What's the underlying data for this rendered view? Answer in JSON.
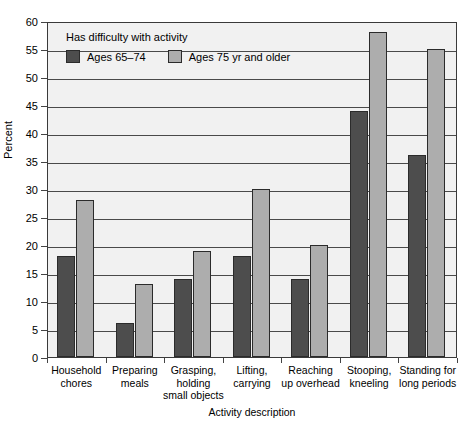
{
  "chart_data": {
    "type": "bar",
    "title": "",
    "xlabel": "Activity description",
    "ylabel": "Percent",
    "ylim": [
      0,
      60
    ],
    "ytick_step": 5,
    "yticks": [
      60,
      55,
      50,
      45,
      40,
      35,
      30,
      25,
      20,
      15,
      10,
      5,
      0
    ],
    "grid": true,
    "legend_position": "inside-top-left",
    "legend_title": "Has difficulty with activity",
    "categories": [
      "Household chores",
      "Preparing meals",
      "Grasping, holding small objects",
      "Lifting, carrying",
      "Reaching up overhead",
      "Stooping, kneeling",
      "Standing for long periods"
    ],
    "category_lines": [
      [
        "Household",
        "chores"
      ],
      [
        "Preparing",
        "meals"
      ],
      [
        "Grasping,",
        "holding",
        "small objects"
      ],
      [
        "Lifting,",
        "carrying"
      ],
      [
        "Reaching",
        "up overhead"
      ],
      [
        "Stooping,",
        "kneeling"
      ],
      [
        "Standing for",
        "long periods"
      ]
    ],
    "series": [
      {
        "name": "Ages 65–74",
        "color": "#4d4d4d",
        "values": [
          18,
          6,
          14,
          18,
          14,
          44,
          36
        ]
      },
      {
        "name": "Ages 75 yr and older",
        "color": "#adadad",
        "values": [
          28,
          13,
          19,
          30,
          20,
          58,
          55
        ]
      }
    ]
  },
  "colors": {
    "series_dark": "#4d4d4d",
    "series_light": "#adadad",
    "plot_background": "#f1f1f1",
    "gridline": "#4a4a4a",
    "axis": "#3a3a3a",
    "text": "#000000"
  }
}
